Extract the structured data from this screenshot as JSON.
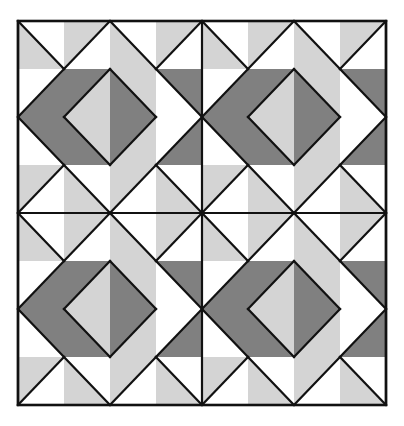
{
  "figure": {
    "name": "quilt-block-pattern",
    "type": "geometric-pattern",
    "canvas": {
      "width": 404,
      "height": 426
    },
    "frame": {
      "x": 18,
      "y": 21,
      "width": 368,
      "height": 384,
      "stroke": "#111111",
      "stroke_width": 2.6
    }
  },
  "palette": {
    "background": "#ffffff",
    "white": "#ffffff",
    "light_gray": "#d4d4d4",
    "dark_gray": "#808080",
    "line": "#111111"
  },
  "geometry": {
    "grid_cols": 8,
    "grid_rows": 8,
    "unit_width": 46,
    "unit_height": 48,
    "quadrant_cols": 4,
    "quadrant_rows": 4,
    "repeat_x": 2,
    "repeat_y": 2,
    "line_width": 2.2
  },
  "chart_data": {
    "type": "table",
    "xlabel": "column",
    "ylabel": "row",
    "legend": [
      "W = white",
      "L = light gray",
      "D = dark gray"
    ],
    "categories": [
      "c0",
      "c1",
      "c2",
      "c3"
    ],
    "units": [
      [
        {
          "dir": "\\",
          "a": "W",
          "b": "L"
        },
        {
          "dir": "/",
          "a": "L",
          "b": "W"
        },
        {
          "dir": "\\",
          "a": "W",
          "b": "L"
        },
        {
          "dir": "/",
          "a": "L",
          "b": "W"
        }
      ],
      [
        {
          "dir": "/",
          "a": "W",
          "b": "D"
        },
        {
          "dir": "/",
          "a": "D",
          "b": "L"
        },
        {
          "dir": "\\",
          "a": "L",
          "b": "D"
        },
        {
          "dir": "\\",
          "a": "D",
          "b": "W"
        }
      ],
      [
        {
          "dir": "\\",
          "a": "D",
          "b": "W"
        },
        {
          "dir": "\\",
          "a": "L",
          "b": "D"
        },
        {
          "dir": "/",
          "a": "D",
          "b": "L"
        },
        {
          "dir": "/",
          "a": "W",
          "b": "D"
        }
      ],
      [
        {
          "dir": "/",
          "a": "L",
          "b": "W"
        },
        {
          "dir": "\\",
          "a": "W",
          "b": "L"
        },
        {
          "dir": "/",
          "a": "L",
          "b": "W"
        },
        {
          "dir": "\\",
          "a": "W",
          "b": "L"
        }
      ]
    ]
  }
}
